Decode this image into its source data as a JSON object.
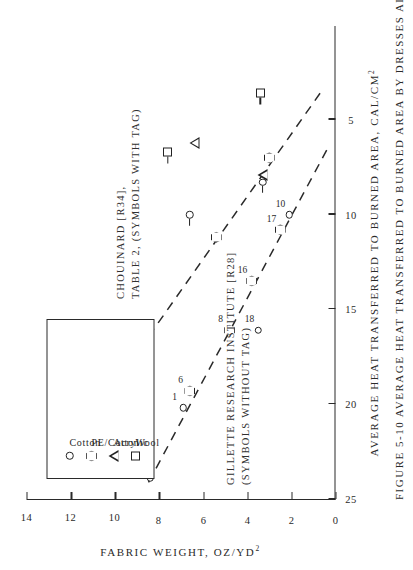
{
  "figure": {
    "caption": "FIGURE 5-10   AVERAGE HEAT TRANSFERRED TO BURNED AREA BY DRESSES ALONE",
    "number": "FIGURE 5-10"
  },
  "chart_data": {
    "type": "scatter",
    "title": "AVERAGE HEAT TRANSFERRED TO BURNED AREA BY DRESSES ALONE",
    "xlabel": "FABRIC WEIGHT, OZ/YD2",
    "xlabel_display": "FABRIC WEIGHT, OZ/YD",
    "xlabel_sup": "2",
    "ylabel": "AVERAGE HEAT TRANSFERRED TO BURNED AREA, CAL/CM2",
    "ylabel_display": "AVERAGE HEAT TRANSFERRED TO BURNED AREA, CAL/CM",
    "ylabel_sup": "2",
    "xlim": [
      0,
      14
    ],
    "ylim": [
      0,
      25
    ],
    "xticks": [
      0,
      2,
      4,
      6,
      8,
      10,
      12,
      14
    ],
    "yticks": [
      5,
      10,
      15,
      20,
      25
    ],
    "xtick_labels": [
      "0",
      "2",
      "4",
      "6",
      "8",
      "10",
      "12",
      "14"
    ],
    "ytick_labels": [
      "5",
      "10",
      "15",
      "20",
      "25"
    ],
    "grid": false,
    "rotation_note": "figure printed rotated 90 degrees counter-clockwise",
    "legend": {
      "position": "upper-right",
      "entries": [
        {
          "label": "Cotton",
          "marker": "circle-small"
        },
        {
          "label": "PE/Cotton",
          "marker": "hexagon"
        },
        {
          "label": "Acrylic",
          "marker": "triangle"
        },
        {
          "label": "Wool",
          "marker": "square"
        }
      ]
    },
    "annotations": [
      {
        "id": "gillette",
        "lines": [
          "GILLETTE RESEARCH INSTITUTE [R28]",
          "(SYMBOLS WITHOUT TAG)"
        ]
      },
      {
        "id": "chouinard",
        "lines": [
          "CHOUINARD [R34],",
          "TABLE 2, (SYMBOLS WITH TAG)"
        ]
      }
    ],
    "series": [
      {
        "name": "Gillette Research Institute [R28]",
        "tagged": false,
        "trendline": {
          "style": "dashed",
          "x": [
            0.4,
            8.6
          ],
          "y": [
            6.6,
            24.4
          ]
        },
        "points": [
          {
            "label": "4",
            "x": 8.4,
            "y": 23.9,
            "marker": "circle-small"
          },
          {
            "label": "1",
            "x": 6.9,
            "y": 20.2,
            "marker": "circle-small"
          },
          {
            "label": "6",
            "x": 6.6,
            "y": 19.3,
            "marker": "hexagon"
          },
          {
            "label": "8",
            "x": 4.8,
            "y": 16.1,
            "marker": "hexagon"
          },
          {
            "label": "16",
            "x": 3.8,
            "y": 13.5,
            "marker": "hexagon"
          },
          {
            "label": "18",
            "x": 3.5,
            "y": 16.1,
            "marker": "circle-small"
          },
          {
            "label": "17",
            "x": 2.5,
            "y": 10.8,
            "marker": "hexagon"
          },
          {
            "label": "10",
            "x": 2.1,
            "y": 10.0,
            "marker": "circle-small"
          }
        ]
      },
      {
        "name": "Chouinard [R34], Table 2",
        "tagged": true,
        "trendline": {
          "style": "dashed",
          "x": [
            0.7,
            11.6
          ],
          "y": [
            3.6,
            21.6
          ]
        },
        "points": [
          {
            "label": "",
            "x": 6.6,
            "y": 10.0,
            "marker": "circle-small"
          },
          {
            "label": "",
            "x": 5.4,
            "y": 11.2,
            "marker": "hexagon"
          },
          {
            "label": "",
            "x": 3.3,
            "y": 8.3,
            "marker": "circle-small"
          },
          {
            "label": "",
            "x": 3.3,
            "y": 7.9,
            "marker": "triangle"
          },
          {
            "label": "",
            "x": 3.0,
            "y": 7.0,
            "marker": "hexagon"
          },
          {
            "label": "",
            "x": 6.4,
            "y": 6.2,
            "marker": "triangle"
          },
          {
            "label": "",
            "x": 7.6,
            "y": 6.7,
            "marker": "square"
          },
          {
            "label": "",
            "x": 3.4,
            "y": 3.6,
            "marker": "square"
          }
        ]
      }
    ]
  },
  "colors": {
    "ink": "#2a2a2a",
    "paper": "#ffffff"
  }
}
